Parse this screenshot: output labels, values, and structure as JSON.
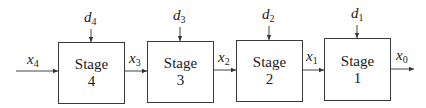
{
  "diagram": {
    "type": "serial multistage system block diagram",
    "stages": [
      {
        "label": "Stage",
        "number": "4",
        "input": "x",
        "input_sub": "4",
        "decision": "d",
        "decision_sub": "4",
        "output": "x",
        "output_sub": "3"
      },
      {
        "label": "Stage",
        "number": "3",
        "input": "x",
        "input_sub": "3",
        "decision": "d",
        "decision_sub": "3",
        "output": "x",
        "output_sub": "2"
      },
      {
        "label": "Stage",
        "number": "2",
        "input": "x",
        "input_sub": "2",
        "decision": "d",
        "decision_sub": "2",
        "output": "x",
        "output_sub": "1"
      },
      {
        "label": "Stage",
        "number": "1",
        "input": "x",
        "input_sub": "1",
        "decision": "d",
        "decision_sub": "1",
        "output": "x",
        "output_sub": "0"
      }
    ],
    "signals": {
      "x4": {
        "base": "x",
        "sub": "4"
      },
      "x3": {
        "base": "x",
        "sub": "3"
      },
      "x2": {
        "base": "x",
        "sub": "2"
      },
      "x1": {
        "base": "x",
        "sub": "1"
      },
      "x0": {
        "base": "x",
        "sub": "0"
      }
    },
    "decisions": {
      "d4": {
        "base": "d",
        "sub": "4"
      },
      "d3": {
        "base": "d",
        "sub": "3"
      },
      "d2": {
        "base": "d",
        "sub": "2"
      },
      "d1": {
        "base": "d",
        "sub": "1"
      }
    }
  }
}
